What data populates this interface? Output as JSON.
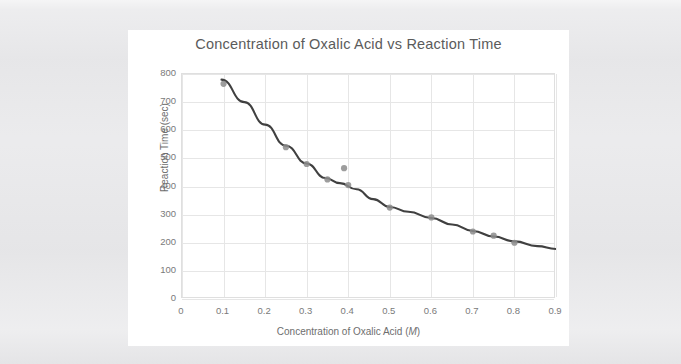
{
  "slide": {
    "background_color": "#e9e9eb",
    "card_color": "#ffffff"
  },
  "chart_data": {
    "type": "scatter",
    "title": "Concentration of Oxalic Acid vs Reaction Time",
    "xlabel_prefix": "Concentration of Oxalic Acid (",
    "xlabel_unit": "M",
    "xlabel_suffix": ")",
    "xlabel": "Concentration of Oxalic Acid (M)",
    "ylabel": "Reaction Time (sec)",
    "xlim": [
      0,
      0.9
    ],
    "ylim": [
      0,
      800
    ],
    "grid": true,
    "legend": "none",
    "marker_color": "#8c8c8c",
    "line_color": "#404040",
    "gridline_color": "#e6e6e6",
    "x_ticks": [
      "0",
      "0.1",
      "0.2",
      "0.3",
      "0.4",
      "0.5",
      "0.6",
      "0.7",
      "0.8",
      "0.9"
    ],
    "x_tick_values": [
      0,
      0.1,
      0.2,
      0.3,
      0.4,
      0.5,
      0.6,
      0.7,
      0.8,
      0.9
    ],
    "y_ticks": [
      "0",
      "100",
      "200",
      "300",
      "400",
      "500",
      "600",
      "700",
      "800"
    ],
    "y_tick_values": [
      0,
      100,
      200,
      300,
      400,
      500,
      600,
      700,
      800
    ],
    "points": [
      {
        "x": 0.1,
        "y": 765
      },
      {
        "x": 0.25,
        "y": 540
      },
      {
        "x": 0.3,
        "y": 480
      },
      {
        "x": 0.35,
        "y": 425
      },
      {
        "x": 0.39,
        "y": 465
      },
      {
        "x": 0.4,
        "y": 405
      },
      {
        "x": 0.5,
        "y": 325
      },
      {
        "x": 0.6,
        "y": 290
      },
      {
        "x": 0.7,
        "y": 240
      },
      {
        "x": 0.75,
        "y": 225
      },
      {
        "x": 0.8,
        "y": 200
      }
    ],
    "trendline": [
      {
        "x": 0.095,
        "y": 780
      },
      {
        "x": 0.15,
        "y": 700
      },
      {
        "x": 0.2,
        "y": 620
      },
      {
        "x": 0.25,
        "y": 545
      },
      {
        "x": 0.3,
        "y": 482
      },
      {
        "x": 0.345,
        "y": 430
      },
      {
        "x": 0.38,
        "y": 412
      },
      {
        "x": 0.42,
        "y": 390
      },
      {
        "x": 0.46,
        "y": 355
      },
      {
        "x": 0.5,
        "y": 327
      },
      {
        "x": 0.545,
        "y": 310
      },
      {
        "x": 0.6,
        "y": 288
      },
      {
        "x": 0.65,
        "y": 265
      },
      {
        "x": 0.7,
        "y": 242
      },
      {
        "x": 0.75,
        "y": 222
      },
      {
        "x": 0.8,
        "y": 205
      },
      {
        "x": 0.855,
        "y": 188
      },
      {
        "x": 0.9,
        "y": 178
      }
    ]
  }
}
